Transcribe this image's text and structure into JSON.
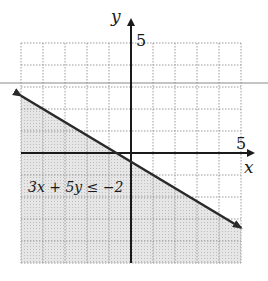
{
  "chart_data": {
    "type": "line",
    "title": "",
    "inequality": "3x + 5y ≤ −2",
    "boundary_line": {
      "equation": "3x + 5y = −2",
      "style": "solid",
      "points": [
        [
          -5,
          2.6
        ],
        [
          5,
          -3.4
        ]
      ]
    },
    "shaded_region": "below line",
    "xlabel": "x",
    "ylabel": "y",
    "xlim": [
      -5,
      5
    ],
    "ylim": [
      -5,
      5
    ],
    "x_tick_labels": [
      "5"
    ],
    "y_tick_labels": [
      "5"
    ],
    "grid": true,
    "grid_step": 1
  },
  "labels": {
    "x_axis": "x",
    "y_axis": "y",
    "x_tick": "5",
    "y_tick": "5",
    "inequality": "3x + 5y ≤ −2"
  },
  "colors": {
    "axis": "#1a1a1a",
    "line": "#2a2a2a",
    "grid": "#9a9a9a",
    "shade": "#d9d9d9",
    "scan_line": "#8a8a8a"
  }
}
